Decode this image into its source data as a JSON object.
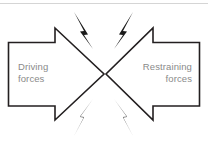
{
  "figure": {
    "background_color": "#ffffff",
    "outline_color": "#231f20",
    "label_color": "#8a8a8a",
    "bolt_color": "#1a1a1a",
    "rule_color": "#d5d5d5"
  },
  "left_arrow": {
    "label": "Driving\nforces",
    "direction": "points-right"
  },
  "right_arrow": {
    "label": "Restraining\nforces",
    "direction": "points-left"
  },
  "bolts": [
    {
      "name": "top-left-bolt"
    },
    {
      "name": "top-right-bolt"
    },
    {
      "name": "bottom-left-bolt"
    },
    {
      "name": "bottom-right-bolt"
    }
  ]
}
